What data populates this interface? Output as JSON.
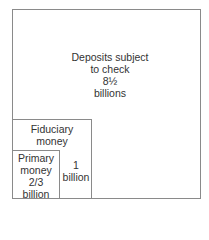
{
  "diagram": {
    "type": "nested-squares",
    "outer": {
      "lines": [
        "Deposits subject",
        "to check",
        "8½",
        "billions"
      ]
    },
    "fiduciary": {
      "lines": [
        "Fiduciary",
        "money"
      ]
    },
    "fiduciary_amount": {
      "lines": [
        "1",
        "billion"
      ]
    },
    "primary": {
      "lines": [
        "Primary",
        "money",
        "2/3",
        "billion"
      ]
    }
  }
}
